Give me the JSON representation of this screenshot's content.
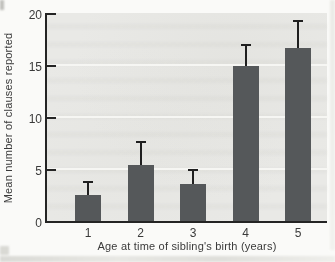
{
  "chart_data": {
    "type": "bar",
    "title": "",
    "categories": [
      "1",
      "2",
      "3",
      "4",
      "5"
    ],
    "values": [
      2.6,
      5.5,
      3.7,
      15.0,
      16.7
    ],
    "error_upper": [
      1.2,
      2.2,
      1.3,
      2.0,
      2.6
    ],
    "xlabel": "Age at time of sibling's birth (years)",
    "ylabel": "Mean number of clauses reported",
    "ylim": [
      0,
      20
    ],
    "yticks": [
      0,
      5,
      10,
      15,
      20
    ],
    "grid": "horizontal white gridlines at 5, 10, 15",
    "legend": "none",
    "colors": {
      "bar": "#55585a",
      "error_bar": "#1f1f1f",
      "plot_background": "#e9e9e6",
      "axis": "#242424",
      "text": "#3a3a3a",
      "gridline": "#f6f6f3",
      "page_background": "#fafaf8"
    }
  }
}
